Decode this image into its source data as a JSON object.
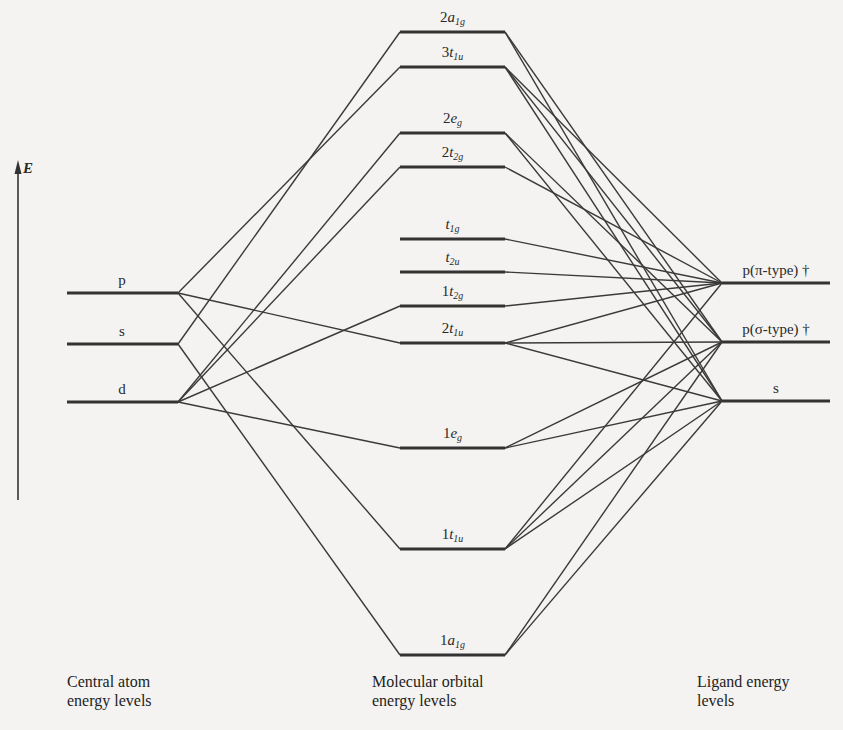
{
  "diagram": {
    "axis": {
      "label": "E",
      "direction": "up"
    },
    "colors": {
      "line": "#333333",
      "background": "#f4f3f1"
    },
    "captions": {
      "left": [
        "Central atom",
        "energy levels"
      ],
      "middle": [
        "Molecular orbital",
        "energy levels"
      ],
      "right": [
        "Ligand energy",
        "levels"
      ]
    },
    "central_atom_levels": [
      {
        "id": "p",
        "label": "p",
        "y": 293
      },
      {
        "id": "s",
        "label": "s",
        "y": 344
      },
      {
        "id": "d",
        "label": "d",
        "y": 402
      }
    ],
    "molecular_orbitals": [
      {
        "id": "2a1g",
        "prefix": "2",
        "sym": "a",
        "sub": "1g",
        "y": 32
      },
      {
        "id": "3t1u",
        "prefix": "3",
        "sym": "t",
        "sub": "1u",
        "y": 67
      },
      {
        "id": "2eg",
        "prefix": "2",
        "sym": "e",
        "sub": "g",
        "y": 133
      },
      {
        "id": "2t2g",
        "prefix": "2",
        "sym": "t",
        "sub": "2g",
        "y": 167
      },
      {
        "id": "t1g",
        "prefix": "",
        "sym": "t",
        "sub": "1g",
        "y": 239
      },
      {
        "id": "t2u",
        "prefix": "",
        "sym": "t",
        "sub": "2u",
        "y": 272
      },
      {
        "id": "1t2g",
        "prefix": "1",
        "sym": "t",
        "sub": "2g",
        "y": 306
      },
      {
        "id": "2t1u",
        "prefix": "2",
        "sym": "t",
        "sub": "1u",
        "y": 343
      },
      {
        "id": "1eg",
        "prefix": "1",
        "sym": "e",
        "sub": "g",
        "y": 448
      },
      {
        "id": "1t1u",
        "prefix": "1",
        "sym": "t",
        "sub": "1u",
        "y": 549
      },
      {
        "id": "1a1g",
        "prefix": "1",
        "sym": "a",
        "sub": "1g",
        "y": 655
      }
    ],
    "ligand_levels": [
      {
        "id": "ppi",
        "label": "p(π-type) †",
        "y": 283
      },
      {
        "id": "psigma",
        "label": "p(σ-type) †",
        "y": 342
      },
      {
        "id": "s",
        "label": "s",
        "y": 401
      }
    ],
    "connections_left": [
      [
        "2a1g",
        "s"
      ],
      [
        "3t1u",
        "p"
      ],
      [
        "2eg",
        "d"
      ],
      [
        "2t2g",
        "d"
      ],
      [
        "1t2g",
        "d"
      ],
      [
        "2t1u",
        "p"
      ],
      [
        "1eg",
        "d"
      ],
      [
        "1t1u",
        "p"
      ],
      [
        "1a1g",
        "s"
      ]
    ],
    "connections_right": [
      [
        "2a1g",
        "psigma"
      ],
      [
        "2a1g",
        "s"
      ],
      [
        "3t1u",
        "ppi"
      ],
      [
        "3t1u",
        "psigma"
      ],
      [
        "3t1u",
        "s"
      ],
      [
        "2eg",
        "psigma"
      ],
      [
        "2eg",
        "s"
      ],
      [
        "2t2g",
        "ppi"
      ],
      [
        "t1g",
        "ppi"
      ],
      [
        "t2u",
        "ppi"
      ],
      [
        "1t2g",
        "ppi"
      ],
      [
        "2t1u",
        "ppi"
      ],
      [
        "2t1u",
        "psigma"
      ],
      [
        "2t1u",
        "s"
      ],
      [
        "1eg",
        "psigma"
      ],
      [
        "1eg",
        "s"
      ],
      [
        "1t1u",
        "ppi"
      ],
      [
        "1t1u",
        "psigma"
      ],
      [
        "1t1u",
        "s"
      ],
      [
        "1a1g",
        "psigma"
      ],
      [
        "1a1g",
        "s"
      ]
    ]
  }
}
